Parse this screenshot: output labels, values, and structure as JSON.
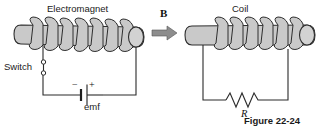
{
  "figure": {
    "caption": "Figure 22-24",
    "field_label": "B",
    "colors": {
      "tube_fill": "#c9c9c9",
      "tube_stroke": "#2e2e2e",
      "wire": "#2b2b2b",
      "arrow_fill": "#8d8d8d",
      "background": "#ffffff"
    }
  },
  "left_circuit": {
    "title": "Electromagnet",
    "switch_label": "Switch",
    "source_label": "emf",
    "minus_sign": "−",
    "plus_sign": "+",
    "coil_turns": 7
  },
  "right_circuit": {
    "title": "Coil",
    "resistor_label": "R",
    "coil_turns": 6
  },
  "icons": {
    "field_arrow": "arrow-right-icon",
    "switch_terminal": "switch-terminal-icon",
    "battery": "battery-icon",
    "resistor": "resistor-zigzag-icon"
  }
}
